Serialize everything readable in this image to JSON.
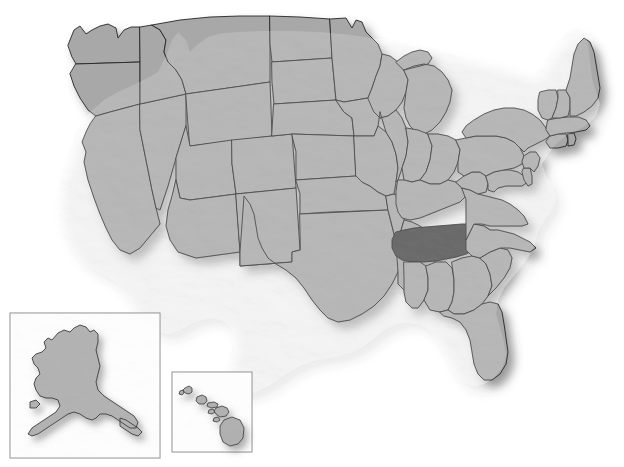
{
  "map": {
    "title": "United States Map",
    "projection": "albers-usa",
    "background_color": "#ffffff",
    "state_fill": "#a8a8a8",
    "state_fill_shaded": "#9c9c9c",
    "highlight_fill": "#4a4a4a",
    "border_color": "#262626",
    "border_width": 0.9,
    "outline_color": "#1a1a1a",
    "outline_width": 1.2,
    "shadow_color": "#5a5a5a",
    "shadow_opacity": 0.55,
    "relief_shading": true,
    "labels_visible": false,
    "highlighted_states": [
      "Tennessee"
    ],
    "insets": [
      {
        "name": "alaska-inset",
        "label": "Alaska",
        "border_color": "#8c8c8c",
        "border_width": 1,
        "x": 10,
        "y": 313,
        "width": 150,
        "height": 145
      },
      {
        "name": "hawaii-inset",
        "label": "Hawaii",
        "border_color": "#8c8c8c",
        "border_width": 1,
        "x": 172,
        "y": 372,
        "width": 80,
        "height": 80
      }
    ],
    "states": [
      {
        "code": "WA",
        "name": "Washington",
        "highlighted": false
      },
      {
        "code": "OR",
        "name": "Oregon",
        "highlighted": false
      },
      {
        "code": "CA",
        "name": "California",
        "highlighted": false
      },
      {
        "code": "NV",
        "name": "Nevada",
        "highlighted": false
      },
      {
        "code": "ID",
        "name": "Idaho",
        "highlighted": false
      },
      {
        "code": "MT",
        "name": "Montana",
        "highlighted": false
      },
      {
        "code": "WY",
        "name": "Wyoming",
        "highlighted": false
      },
      {
        "code": "UT",
        "name": "Utah",
        "highlighted": false
      },
      {
        "code": "AZ",
        "name": "Arizona",
        "highlighted": false
      },
      {
        "code": "NM",
        "name": "New Mexico",
        "highlighted": false
      },
      {
        "code": "CO",
        "name": "Colorado",
        "highlighted": false
      },
      {
        "code": "ND",
        "name": "North Dakota",
        "highlighted": false
      },
      {
        "code": "SD",
        "name": "South Dakota",
        "highlighted": false
      },
      {
        "code": "NE",
        "name": "Nebraska",
        "highlighted": false
      },
      {
        "code": "KS",
        "name": "Kansas",
        "highlighted": false
      },
      {
        "code": "OK",
        "name": "Oklahoma",
        "highlighted": false
      },
      {
        "code": "TX",
        "name": "Texas",
        "highlighted": false
      },
      {
        "code": "MN",
        "name": "Minnesota",
        "highlighted": false
      },
      {
        "code": "IA",
        "name": "Iowa",
        "highlighted": false
      },
      {
        "code": "MO",
        "name": "Missouri",
        "highlighted": false
      },
      {
        "code": "AR",
        "name": "Arkansas",
        "highlighted": false
      },
      {
        "code": "LA",
        "name": "Louisiana",
        "highlighted": false
      },
      {
        "code": "WI",
        "name": "Wisconsin",
        "highlighted": false
      },
      {
        "code": "IL",
        "name": "Illinois",
        "highlighted": false
      },
      {
        "code": "MI",
        "name": "Michigan",
        "highlighted": false
      },
      {
        "code": "IN",
        "name": "Indiana",
        "highlighted": false
      },
      {
        "code": "OH",
        "name": "Ohio",
        "highlighted": false
      },
      {
        "code": "KY",
        "name": "Kentucky",
        "highlighted": false
      },
      {
        "code": "TN",
        "name": "Tennessee",
        "highlighted": true
      },
      {
        "code": "MS",
        "name": "Mississippi",
        "highlighted": false
      },
      {
        "code": "AL",
        "name": "Alabama",
        "highlighted": false
      },
      {
        "code": "GA",
        "name": "Georgia",
        "highlighted": false
      },
      {
        "code": "FL",
        "name": "Florida",
        "highlighted": false
      },
      {
        "code": "SC",
        "name": "South Carolina",
        "highlighted": false
      },
      {
        "code": "NC",
        "name": "North Carolina",
        "highlighted": false
      },
      {
        "code": "VA",
        "name": "Virginia",
        "highlighted": false
      },
      {
        "code": "WV",
        "name": "West Virginia",
        "highlighted": false
      },
      {
        "code": "MD",
        "name": "Maryland",
        "highlighted": false
      },
      {
        "code": "DE",
        "name": "Delaware",
        "highlighted": false
      },
      {
        "code": "PA",
        "name": "Pennsylvania",
        "highlighted": false
      },
      {
        "code": "NJ",
        "name": "New Jersey",
        "highlighted": false
      },
      {
        "code": "NY",
        "name": "New York",
        "highlighted": false
      },
      {
        "code": "CT",
        "name": "Connecticut",
        "highlighted": false
      },
      {
        "code": "RI",
        "name": "Rhode Island",
        "highlighted": false
      },
      {
        "code": "MA",
        "name": "Massachusetts",
        "highlighted": false
      },
      {
        "code": "VT",
        "name": "Vermont",
        "highlighted": false
      },
      {
        "code": "NH",
        "name": "New Hampshire",
        "highlighted": false
      },
      {
        "code": "ME",
        "name": "Maine",
        "highlighted": false
      },
      {
        "code": "AK",
        "name": "Alaska",
        "highlighted": false
      },
      {
        "code": "HI",
        "name": "Hawaii",
        "highlighted": false
      }
    ]
  }
}
